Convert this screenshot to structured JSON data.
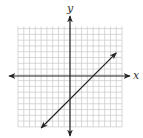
{
  "chart_data": {
    "type": "line",
    "title": "",
    "xlabel": "x",
    "ylabel": "y",
    "xlim": [
      -9,
      9
    ],
    "ylim": [
      -9,
      9
    ],
    "grid": true,
    "grid_step": 1,
    "series": [
      {
        "name": "line",
        "equation": "y = x - 4",
        "slope": 1,
        "y_intercept": -4,
        "x_intercept": 4,
        "x": [
          -5,
          8
        ],
        "y": [
          -9,
          4
        ],
        "arrows_both_ends": true
      }
    ]
  },
  "labels": {
    "x_axis": "x",
    "y_axis": "y"
  },
  "colors": {
    "grid": "#c8c8c8",
    "axis": "#222222",
    "line": "#222222",
    "background": "#ffffff"
  }
}
